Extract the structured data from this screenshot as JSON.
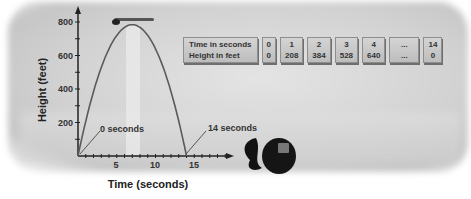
{
  "chart_data": {
    "type": "line",
    "title": "",
    "xlabel": "Time (seconds)",
    "ylabel": "Height (feet)",
    "xlim": [
      0,
      19
    ],
    "ylim": [
      0,
      850
    ],
    "x_ticks": [
      5,
      10,
      15
    ],
    "y_ticks": [
      200,
      400,
      600,
      800
    ],
    "grid": false,
    "series": [
      {
        "name": "height",
        "x": [
          0,
          1,
          2,
          3,
          4,
          5,
          6,
          7,
          8,
          9,
          10,
          11,
          12,
          13,
          14
        ],
        "y": [
          0,
          208,
          384,
          528,
          640,
          720,
          768,
          784,
          768,
          720,
          640,
          528,
          384,
          208,
          0
        ]
      }
    ],
    "annotations": [
      "0 seconds",
      "14 seconds"
    ],
    "table": {
      "row_labels": [
        "Time in seconds",
        "Height in feet"
      ],
      "columns": [
        {
          "time": "0",
          "height": "0"
        },
        {
          "time": "1",
          "height": "208"
        },
        {
          "time": "2",
          "height": "384"
        },
        {
          "time": "3",
          "height": "528"
        },
        {
          "time": "4",
          "height": "640"
        },
        {
          "time": "...",
          "height": "..."
        },
        {
          "time": "14",
          "height": "0"
        }
      ]
    }
  },
  "labels": {
    "xlabel": "Time (seconds)",
    "ylabel": "Height (feet)",
    "ann0": "0 seconds",
    "ann14": "14 seconds",
    "x5": "5",
    "x10": "10",
    "x15": "15",
    "y200": "200",
    "y400": "400",
    "y600": "600",
    "y800": "800"
  }
}
